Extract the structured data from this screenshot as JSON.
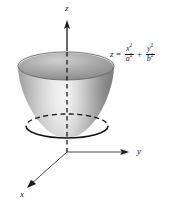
{
  "figure": {
    "surface_name": "elliptic-paraboloid",
    "background_color": "#ffffff",
    "ink_color": "#1a1a1a",
    "surface_light_color": "#f2f2f2",
    "surface_mid_color": "#b8b8b8",
    "surface_dark_color": "#6e6e6e",
    "surface_interior_color": "#8d8d8d"
  },
  "axes": {
    "z": {
      "label": "z",
      "direction": "up",
      "arrow": "arrowhead-up",
      "origin_px": [
        67,
        152
      ],
      "tip_px": [
        67,
        22
      ],
      "hidden_segment": "dashed-through-surface"
    },
    "y": {
      "label": "y",
      "direction": "right",
      "arrow": "arrowhead-right",
      "origin_px": [
        67,
        152
      ],
      "tip_px": [
        128,
        152
      ]
    },
    "x": {
      "label": "x",
      "direction": "down-left",
      "arrow": "arrowhead-down-left",
      "origin_px": [
        67,
        152
      ],
      "tip_px": [
        28,
        187
      ]
    }
  },
  "equation": {
    "lhs": "z",
    "equals": "=",
    "term1": {
      "numerator": "x",
      "numerator_exp": "2",
      "denominator": "a",
      "denominator_exp": "2"
    },
    "plus": "+",
    "term2": {
      "numerator": "y",
      "numerator_exp": "2",
      "denominator": "b",
      "denominator_exp": "2"
    },
    "plain_text": "z = x^2/a^2 + y^2/b^2"
  },
  "traces": {
    "rim_ellipse": {
      "name": "top-rim-ellipse",
      "style": "solid",
      "center_px": [
        66,
        66
      ],
      "rx": 48,
      "ry": 14
    },
    "cross_section_ellipse": {
      "name": "horizontal-trace-ellipse",
      "front_style": "solid",
      "back_style": "dashed",
      "center_px": [
        67,
        126
      ],
      "rx": 41,
      "ry": 12
    }
  }
}
